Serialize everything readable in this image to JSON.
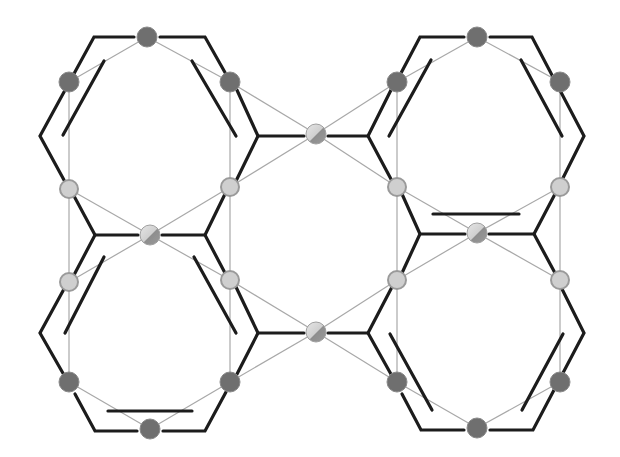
{
  "diagram": {
    "type": "molecular-framework",
    "colors": {
      "background": "#ffffff",
      "bond": "#1c1c1c",
      "thin_link": "#a8a8a8",
      "dark_node": "#6f6f6f",
      "light_node": "#cfcfcf",
      "metal_node_light": "#e0e0e0",
      "metal_node_dark": "#8a8a8a"
    },
    "nodes": {
      "dark": [
        {
          "id": "d1",
          "x": 147,
          "y": 37
        },
        {
          "id": "d2",
          "x": 69,
          "y": 82
        },
        {
          "id": "d3",
          "x": 230,
          "y": 82
        },
        {
          "id": "d4",
          "x": 477,
          "y": 37
        },
        {
          "id": "d5",
          "x": 397,
          "y": 82
        },
        {
          "id": "d6",
          "x": 560,
          "y": 82
        },
        {
          "id": "d7",
          "x": 69,
          "y": 382
        },
        {
          "id": "d8",
          "x": 230,
          "y": 382
        },
        {
          "id": "d9",
          "x": 150,
          "y": 429
        },
        {
          "id": "d10",
          "x": 397,
          "y": 382
        },
        {
          "id": "d11",
          "x": 560,
          "y": 382
        },
        {
          "id": "d12",
          "x": 477,
          "y": 428
        }
      ],
      "light": [
        {
          "id": "l1",
          "x": 69,
          "y": 189
        },
        {
          "id": "l2",
          "x": 230,
          "y": 187
        },
        {
          "id": "l3",
          "x": 69,
          "y": 282
        },
        {
          "id": "l4",
          "x": 230,
          "y": 280
        },
        {
          "id": "l5",
          "x": 397,
          "y": 187
        },
        {
          "id": "l6",
          "x": 560,
          "y": 187
        },
        {
          "id": "l7",
          "x": 397,
          "y": 280
        },
        {
          "id": "l8",
          "x": 560,
          "y": 280
        }
      ],
      "metal": [
        {
          "id": "m1",
          "x": 316,
          "y": 134
        },
        {
          "id": "m2",
          "x": 150,
          "y": 235
        },
        {
          "id": "m3",
          "x": 477,
          "y": 233
        },
        {
          "id": "m4",
          "x": 316,
          "y": 332
        }
      ]
    }
  }
}
